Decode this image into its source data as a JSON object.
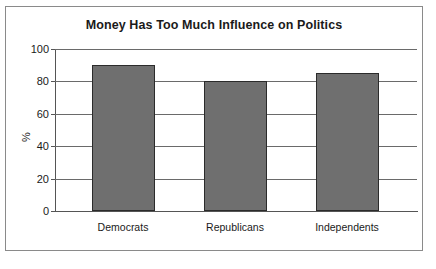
{
  "chart_data": {
    "type": "bar",
    "title": "Money Has Too Much Influence on Politics",
    "xlabel": "",
    "ylabel": "%",
    "categories": [
      "Democrats",
      "Republicans",
      "Independents"
    ],
    "values": [
      90,
      80,
      85
    ],
    "ylim": [
      0,
      100
    ],
    "yticks": [
      0,
      20,
      40,
      60,
      80,
      100
    ],
    "ytick_labels": [
      "0",
      "20",
      "40",
      "60",
      "80",
      "100"
    ],
    "grid": true,
    "grid_axis": "y",
    "legend": null,
    "legend_position": "none",
    "series": [
      {
        "name": "Share agreeing",
        "values": [
          90,
          80,
          85
        ]
      }
    ],
    "colors": {
      "bar_fill": "#6f6f6f",
      "bar_edge": "#2b2b2b",
      "grid": "#6a6a6a",
      "axis": "#555555",
      "text": "#1a1a1a",
      "frame": "#8a8a8a",
      "background": "#ffffff"
    }
  }
}
